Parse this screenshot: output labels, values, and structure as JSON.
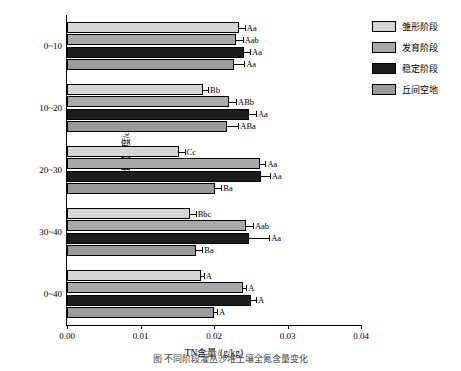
{
  "chart_data": {
    "type": "bar",
    "orientation": "horizontal",
    "title": "",
    "xlabel": "TN含量/(g/kg)",
    "ylabel": "土层深度/cm",
    "xlim": [
      0.0,
      0.04
    ],
    "xticks": [
      "0.00",
      "0.01",
      "0.02",
      "0.03",
      "0.04"
    ],
    "xtick_values": [
      0.0,
      0.01,
      0.02,
      0.03,
      0.04
    ],
    "categories": [
      "0~10",
      "10~20",
      "20~30",
      "30~40",
      "0~40"
    ],
    "grid": false,
    "legend_position": "right",
    "series": [
      {
        "name": "雏形阶段",
        "color": "#d6d6d6",
        "values": [
          0.0234,
          0.0185,
          0.0152,
          0.0167,
          0.0182
        ],
        "errors": [
          0.0008,
          0.0007,
          0.0008,
          0.0008,
          0.0004
        ],
        "sig_labels": [
          "Aa",
          "Bb",
          "Cc",
          "Bbc",
          "A"
        ]
      },
      {
        "name": "发育阶段",
        "color": "#a9a9a9",
        "values": [
          0.023,
          0.022,
          0.0262,
          0.0244,
          0.0239
        ],
        "errors": [
          0.0009,
          0.001,
          0.0008,
          0.0009,
          0.0005
        ],
        "sig_labels": [
          "Aab",
          "ABb",
          "Aa",
          "Aab",
          "A"
        ]
      },
      {
        "name": "稳定阶段",
        "color": "#1c1c1c",
        "values": [
          0.0241,
          0.0248,
          0.0264,
          0.0247,
          0.025
        ],
        "errors": [
          0.0008,
          0.0009,
          0.0012,
          0.0028,
          0.0007
        ],
        "sig_labels": [
          "Aa",
          "Aa",
          "Aa",
          "Aa",
          "A"
        ]
      },
      {
        "name": "丘间空地",
        "color": "#9a9a9a",
        "values": [
          0.0227,
          0.0218,
          0.0202,
          0.0176,
          0.02
        ],
        "errors": [
          0.0014,
          0.0015,
          0.0008,
          0.0008,
          0.0004
        ],
        "sig_labels": [
          "Aa",
          "ABa",
          "Ba",
          "Ba",
          "A"
        ]
      }
    ]
  },
  "legend": {
    "items": [
      {
        "label": "雏形阶段",
        "color": "#d6d6d6"
      },
      {
        "label": "发育阶段",
        "color": "#a9a9a9"
      },
      {
        "label": "稳定阶段",
        "color": "#1c1c1c"
      },
      {
        "label": "丘间空地",
        "color": "#9a9a9a"
      }
    ]
  },
  "caption": "图    不同阶段灌丛沙堆土壤全氮含量变化"
}
